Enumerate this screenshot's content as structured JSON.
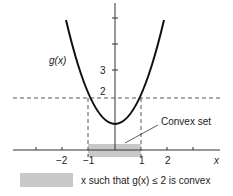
{
  "figure": {
    "curve_label": "g(x)",
    "y_tick_labels": [
      "3",
      "2"
    ],
    "x_tick_labels": [
      "−2",
      "−1",
      "1",
      "2"
    ],
    "x_axis_label": "x",
    "threshold_value": 2,
    "annotation": "Convex set",
    "legend": {
      "text": "x such that g(x) ≤ 2 is convex"
    },
    "colors": {
      "curve": "#111111",
      "axes": "#333333",
      "shade": "#c8c8c8",
      "dashed": "#555555"
    }
  }
}
